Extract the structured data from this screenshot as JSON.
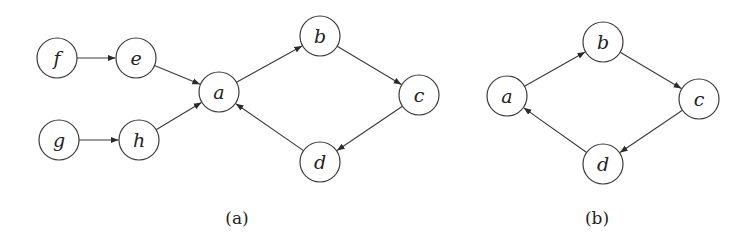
{
  "figure": {
    "panels": [
      {
        "id": "a",
        "caption": "(a)",
        "caption_pos": [
          237,
          224
        ],
        "nodes": [
          {
            "id": "f",
            "label": "f",
            "x": 57,
            "y": 58
          },
          {
            "id": "e",
            "label": "e",
            "x": 136,
            "y": 58
          },
          {
            "id": "a",
            "label": "a",
            "x": 219,
            "y": 92
          },
          {
            "id": "g",
            "label": "g",
            "x": 59,
            "y": 140
          },
          {
            "id": "h",
            "label": "h",
            "x": 139,
            "y": 140
          },
          {
            "id": "b",
            "label": "b",
            "x": 320,
            "y": 36
          },
          {
            "id": "c",
            "label": "c",
            "x": 419,
            "y": 95
          },
          {
            "id": "d",
            "label": "d",
            "x": 320,
            "y": 162
          }
        ],
        "edges": [
          {
            "from": "f",
            "to": "e"
          },
          {
            "from": "e",
            "to": "a"
          },
          {
            "from": "g",
            "to": "h"
          },
          {
            "from": "h",
            "to": "a"
          },
          {
            "from": "a",
            "to": "b"
          },
          {
            "from": "b",
            "to": "c"
          },
          {
            "from": "c",
            "to": "d"
          },
          {
            "from": "d",
            "to": "a"
          }
        ]
      },
      {
        "id": "b",
        "caption": "(b)",
        "caption_pos": [
          597,
          224
        ],
        "nodes": [
          {
            "id": "a",
            "label": "a",
            "x": 507,
            "y": 96
          },
          {
            "id": "b",
            "label": "b",
            "x": 603,
            "y": 42
          },
          {
            "id": "c",
            "label": "c",
            "x": 699,
            "y": 99
          },
          {
            "id": "d",
            "label": "d",
            "x": 603,
            "y": 164
          }
        ],
        "edges": [
          {
            "from": "a",
            "to": "b"
          },
          {
            "from": "b",
            "to": "c"
          },
          {
            "from": "c",
            "to": "d"
          },
          {
            "from": "d",
            "to": "a"
          }
        ]
      }
    ],
    "node_radius": 20,
    "stroke_color": "#3a3a3a"
  }
}
